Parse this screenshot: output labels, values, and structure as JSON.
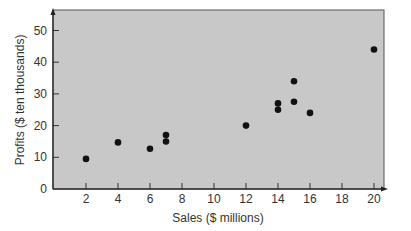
{
  "chart_data": {
    "type": "scatter",
    "title": "",
    "xlabel": "Sales ($ millions)",
    "ylabel": "Profits ($ ten thousands)",
    "xlim": [
      0,
      21.5
    ],
    "ylim": [
      0,
      56
    ],
    "xticks": [
      2,
      4,
      6,
      8,
      10,
      12,
      14,
      16,
      18,
      20
    ],
    "yticks": [
      0,
      10,
      20,
      30,
      40,
      50
    ],
    "grid": false,
    "legend": null,
    "series": [
      {
        "name": "Companies",
        "points": [
          {
            "x": 2,
            "y": 9.5
          },
          {
            "x": 4,
            "y": 14.7
          },
          {
            "x": 6,
            "y": 12.7
          },
          {
            "x": 7,
            "y": 15
          },
          {
            "x": 7,
            "y": 17
          },
          {
            "x": 12,
            "y": 20
          },
          {
            "x": 14,
            "y": 25
          },
          {
            "x": 14,
            "y": 27
          },
          {
            "x": 15,
            "y": 27.5
          },
          {
            "x": 15,
            "y": 34
          },
          {
            "x": 16,
            "y": 24
          },
          {
            "x": 20,
            "y": 44
          }
        ]
      }
    ],
    "colors": {
      "plot_background": "#c8c8c8",
      "point": "#111111",
      "axis": "#333333"
    }
  }
}
